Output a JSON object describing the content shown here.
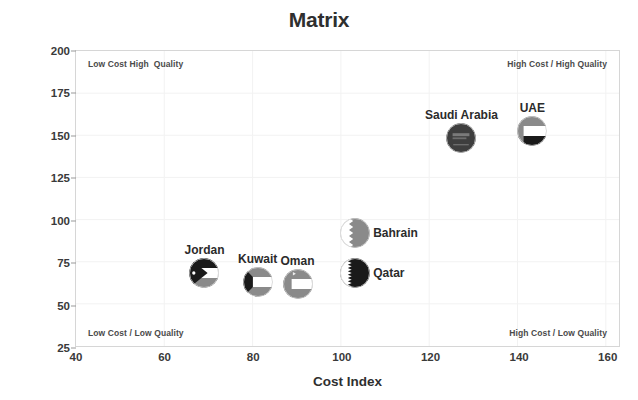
{
  "chart_data": {
    "type": "scatter",
    "title": "Matrix",
    "xlabel": "Cost Index",
    "ylabel": "Quality Score",
    "xlim": [
      40,
      163
    ],
    "ylim": [
      25,
      200
    ],
    "xticks": [
      40,
      60,
      80,
      100,
      120,
      140,
      160
    ],
    "yticks": [
      25,
      50,
      75,
      100,
      125,
      150,
      175,
      200
    ],
    "grid": true,
    "legend": "none",
    "annotations": {
      "top_left": "Low Cost High  Quality",
      "top_right": "High Cost / High Quality",
      "bottom_left": "Low Cost / Low Quality",
      "bottom_right": "High Cost / Low Quality"
    },
    "points": [
      {
        "name": "Jordan",
        "x": 69,
        "y": 69,
        "marker": "jordan-flag-icon",
        "label_pos": "above",
        "radius": 15
      },
      {
        "name": "Kuwait",
        "x": 81,
        "y": 64,
        "marker": "kuwait-flag-icon",
        "label_pos": "above",
        "radius": 15
      },
      {
        "name": "Oman",
        "x": 90,
        "y": 63,
        "marker": "oman-flag-icon",
        "label_pos": "above",
        "radius": 15
      },
      {
        "name": "Bahrain",
        "x": 103,
        "y": 93,
        "marker": "bahrain-flag-icon",
        "label_pos": "right",
        "radius": 15
      },
      {
        "name": "Qatar",
        "x": 103,
        "y": 69,
        "marker": "qatar-flag-icon",
        "label_pos": "right",
        "radius": 15
      },
      {
        "name": "Saudi Arabia",
        "x": 127,
        "y": 149,
        "marker": "saudi-arabia-flag-icon",
        "label_pos": "above",
        "radius": 15
      },
      {
        "name": "UAE",
        "x": 143,
        "y": 153,
        "marker": "uae-flag-icon",
        "label_pos": "above",
        "radius": 15
      }
    ]
  },
  "colors": {
    "title": "#2f2f2f",
    "axis_text": "#3a3a3a",
    "grid": "#f2f2f2",
    "frame": "#d6d6d6",
    "quadrant_text": "#4a4a4a",
    "flag_dark": "#1a1a1a",
    "flag_mid": "#8a8a8a",
    "flag_light": "#ffffff",
    "saudi_green": "#3a3a3a"
  }
}
